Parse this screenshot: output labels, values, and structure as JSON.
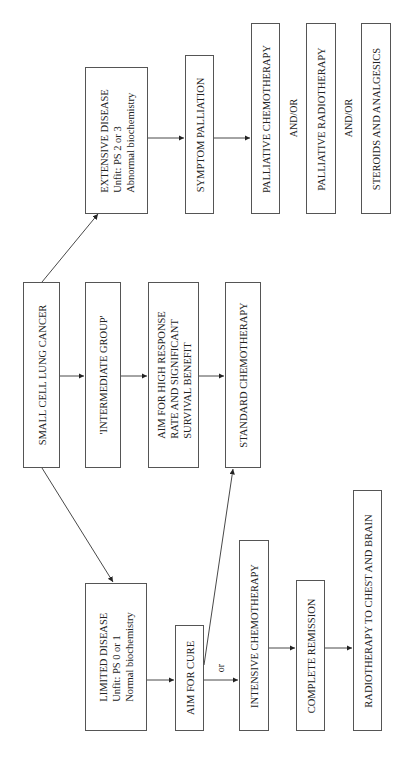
{
  "diagram": {
    "orientation": "rotated-90-ccw",
    "nodes": {
      "sclc": {
        "lines": [
          "SMALL CELL LUNG CANCER"
        ]
      },
      "extensive": {
        "lines": [
          "EXTENSIVE DISEASE",
          "Unfit: PS 2 or 3",
          "Abnormal biochemistry"
        ]
      },
      "intermediate": {
        "lines": [
          "'INTERMEDIATE GROUP'"
        ]
      },
      "limited": {
        "lines": [
          "LIMITED DISEASE",
          "Unfit: PS 0 or 1",
          "Normal biochemistry"
        ]
      },
      "symptom_palliation": {
        "lines": [
          "SYMPTOM PALLIATION"
        ]
      },
      "palliative_chemo": {
        "lines": [
          "PALLIATIVE CHEMOTHERAPY"
        ]
      },
      "palliative_radio": {
        "lines": [
          "PALLIATIVE RADIOTHERAPY"
        ]
      },
      "steroids": {
        "lines": [
          "STEROIDS AND ANALGESICS"
        ]
      },
      "aim_high": {
        "lines": [
          "AIM FOR HIGH RESPONSE",
          "RATE AND SIGNIFICANT",
          "SURVIVAL BENEFIT"
        ]
      },
      "standard_chemo": {
        "lines": [
          "STANDARD CHEMOTHERAPY"
        ]
      },
      "aim_cure": {
        "lines": [
          "AIM FOR CURE"
        ]
      },
      "intensive_chemo": {
        "lines": [
          "INTENSIVE CHEMOTHERAPY"
        ]
      },
      "complete_remission": {
        "lines": [
          "COMPLETE REMISSION"
        ]
      },
      "radiotherapy": {
        "lines": [
          "RADIOTHERAPY TO CHEST AND BRAIN"
        ]
      }
    },
    "labels": {
      "andor_1": "AND/OR",
      "andor_2": "AND/OR",
      "or": "or"
    },
    "edges": [
      [
        "sclc",
        "extensive"
      ],
      [
        "sclc",
        "intermediate"
      ],
      [
        "sclc",
        "limited"
      ],
      [
        "extensive",
        "symptom_palliation"
      ],
      [
        "symptom_palliation",
        "palliative_chemo"
      ],
      [
        "intermediate",
        "aim_high"
      ],
      [
        "aim_high",
        "standard_chemo"
      ],
      [
        "limited",
        "aim_cure"
      ],
      [
        "aim_cure",
        "standard_chemo"
      ],
      [
        "aim_cure",
        "intensive_chemo"
      ],
      [
        "intensive_chemo",
        "complete_remission"
      ],
      [
        "complete_remission",
        "radiotherapy"
      ]
    ]
  }
}
